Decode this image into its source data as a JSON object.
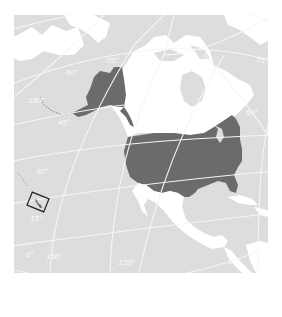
{
  "map": {
    "title": "United States locator map",
    "colors": {
      "ocean": "#dddddd",
      "land_other": "#ffffff",
      "land_highlight": "#6b6b6b",
      "graticule": "#f6f6f6",
      "inset_box": "#222222"
    },
    "highlighted_regions": [
      "Alaska",
      "Contiguous United States",
      "Hawaii"
    ],
    "other_regions": [
      "Canada",
      "Mexico",
      "Russia",
      "Greenland",
      "Cuba"
    ],
    "graticule_labels": {
      "lat_75": "75°",
      "lat_60": "60°",
      "lat_45": "45°",
      "lat_30": "30°",
      "lat_15": "15°",
      "lat_0": "0°",
      "lon_180": "180°",
      "lon_150": "150°",
      "lon_120": "120°",
      "lon_90": "90°",
      "lon_60": "60°"
    },
    "inset_box_label": "Hawaii inset"
  }
}
